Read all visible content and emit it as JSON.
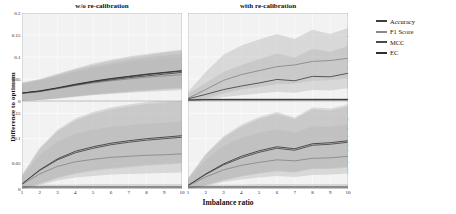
{
  "chart_data": {
    "type": "line",
    "title": "",
    "xlabel": "Imbalance ratio",
    "ylabel": "Difference to optimum",
    "grid": true,
    "legend_position": "right",
    "legend": [
      "Accuracy",
      "F1 Score",
      "MCC",
      "EC"
    ],
    "colors": {
      "accuracy": "#3f3f3f",
      "f1": "#8a8a8a",
      "mcc": "#4a4a4a",
      "ec": "#2e2e2e",
      "band": "#b8b8b8",
      "panel_bg": "#f2f2f2",
      "gridline": "#ffffff"
    },
    "facet_cols": [
      "w/o re-calibration",
      "with re-calibration"
    ],
    "facet_rows": [
      "Argmax decision",
      "Optimised threshold"
    ],
    "x": [
      1,
      2,
      3,
      4,
      5,
      6,
      7,
      8,
      9,
      10
    ],
    "xlim": [
      1,
      10
    ],
    "xticks": [
      "1",
      "2",
      "3",
      "4",
      "5",
      "6",
      "7",
      "8",
      "9",
      "10"
    ],
    "row_yticks": [
      [
        "0.2",
        "0.15",
        "0.1",
        "0.05",
        "0"
      ],
      [
        "0.15",
        "0.1",
        "0.05",
        "0"
      ]
    ],
    "row_ylim": [
      [
        0,
        0.2
      ],
      [
        0,
        0.175
      ]
    ],
    "panels": [
      {
        "row": "Argmax decision",
        "col": "w/o re-calibration",
        "series": [
          {
            "name": "Accuracy",
            "values": [
              0.018,
              0.022,
              0.029,
              0.037,
              0.044,
              0.05,
              0.055,
              0.06,
              0.064,
              0.068
            ],
            "band_lo": [
              0.0,
              0.002,
              0.006,
              0.011,
              0.015,
              0.019,
              0.022,
              0.025,
              0.028,
              0.03
            ],
            "band_hi": [
              0.041,
              0.049,
              0.06,
              0.072,
              0.082,
              0.091,
              0.098,
              0.104,
              0.11,
              0.114
            ]
          },
          {
            "name": "F1 Score",
            "values": [
              0.017,
              0.021,
              0.028,
              0.035,
              0.041,
              0.046,
              0.05,
              0.054,
              0.057,
              0.06
            ],
            "band_lo": [
              0.0,
              0.002,
              0.005,
              0.009,
              0.013,
              0.016,
              0.019,
              0.021,
              0.023,
              0.025
            ],
            "band_hi": [
              0.038,
              0.046,
              0.056,
              0.066,
              0.075,
              0.082,
              0.088,
              0.093,
              0.097,
              0.1
            ]
          },
          {
            "name": "MCC",
            "values": [
              0.018,
              0.022,
              0.029,
              0.036,
              0.043,
              0.048,
              0.053,
              0.057,
              0.061,
              0.065
            ],
            "band_lo": [
              0.0,
              0.002,
              0.006,
              0.01,
              0.014,
              0.017,
              0.02,
              0.023,
              0.026,
              0.028
            ],
            "band_hi": [
              0.04,
              0.048,
              0.058,
              0.069,
              0.078,
              0.086,
              0.093,
              0.099,
              0.104,
              0.108
            ]
          },
          {
            "name": "EC",
            "values": [
              0.018,
              0.023,
              0.03,
              0.038,
              0.045,
              0.051,
              0.056,
              0.061,
              0.065,
              0.069
            ],
            "band_lo": [
              0.0,
              0.003,
              0.007,
              0.012,
              0.016,
              0.02,
              0.023,
              0.026,
              0.029,
              0.032
            ],
            "band_hi": [
              0.042,
              0.05,
              0.062,
              0.074,
              0.085,
              0.094,
              0.101,
              0.107,
              0.112,
              0.117
            ]
          }
        ]
      },
      {
        "row": "Argmax decision",
        "col": "with re-calibration",
        "series": [
          {
            "name": "Accuracy",
            "values": [
              0.002,
              0.003,
              0.003,
              0.003,
              0.003,
              0.003,
              0.003,
              0.003,
              0.003,
              0.003
            ],
            "band_lo": [
              0.0,
              0.0,
              0.0,
              0.0,
              0.0,
              0.0,
              0.0,
              0.0,
              0.0,
              0.0
            ],
            "band_hi": [
              0.005,
              0.006,
              0.006,
              0.007,
              0.007,
              0.007,
              0.007,
              0.007,
              0.007,
              0.007
            ]
          },
          {
            "name": "F1 Score",
            "values": [
              0.006,
              0.026,
              0.047,
              0.06,
              0.069,
              0.078,
              0.082,
              0.09,
              0.092,
              0.097
            ],
            "band_lo": [
              0.0,
              0.006,
              0.017,
              0.026,
              0.032,
              0.038,
              0.04,
              0.046,
              0.047,
              0.051
            ],
            "band_hi": [
              0.021,
              0.066,
              0.105,
              0.126,
              0.14,
              0.152,
              0.141,
              0.162,
              0.152,
              0.166
            ]
          },
          {
            "name": "MCC",
            "values": [
              0.005,
              0.015,
              0.026,
              0.034,
              0.041,
              0.049,
              0.046,
              0.056,
              0.055,
              0.063
            ],
            "band_lo": [
              0.0,
              0.003,
              0.009,
              0.013,
              0.017,
              0.021,
              0.019,
              0.025,
              0.024,
              0.029
            ],
            "band_hi": [
              0.016,
              0.041,
              0.066,
              0.082,
              0.095,
              0.108,
              0.099,
              0.118,
              0.112,
              0.125
            ]
          },
          {
            "name": "EC",
            "values": [
              0.002,
              0.003,
              0.003,
              0.003,
              0.003,
              0.003,
              0.003,
              0.003,
              0.003,
              0.003
            ],
            "band_lo": [
              0.0,
              0.0,
              0.0,
              0.0,
              0.0,
              0.0,
              0.0,
              0.0,
              0.0,
              0.0
            ],
            "band_hi": [
              0.005,
              0.006,
              0.006,
              0.006,
              0.006,
              0.006,
              0.006,
              0.006,
              0.006,
              0.006
            ]
          }
        ]
      },
      {
        "row": "Optimised threshold",
        "col": "w/o re-calibration",
        "series": [
          {
            "name": "Accuracy",
            "values": [
              0.01,
              0.038,
              0.06,
              0.075,
              0.084,
              0.091,
              0.096,
              0.1,
              0.103,
              0.106
            ],
            "band_lo": [
              0.0,
              0.011,
              0.023,
              0.032,
              0.038,
              0.042,
              0.045,
              0.048,
              0.05,
              0.052
            ],
            "band_hi": [
              0.028,
              0.082,
              0.118,
              0.14,
              0.153,
              0.162,
              0.168,
              0.173,
              0.176,
              0.179
            ]
          },
          {
            "name": "F1 Score",
            "values": [
              0.009,
              0.03,
              0.045,
              0.054,
              0.059,
              0.063,
              0.065,
              0.067,
              0.068,
              0.07
            ],
            "band_lo": [
              0.0,
              0.008,
              0.017,
              0.023,
              0.026,
              0.029,
              0.03,
              0.031,
              0.032,
              0.033
            ],
            "band_hi": [
              0.025,
              0.068,
              0.095,
              0.11,
              0.118,
              0.124,
              0.127,
              0.13,
              0.132,
              0.134
            ]
          },
          {
            "name": "MCC",
            "values": [
              0.01,
              0.037,
              0.058,
              0.072,
              0.081,
              0.088,
              0.093,
              0.097,
              0.1,
              0.103
            ],
            "band_lo": [
              0.0,
              0.01,
              0.022,
              0.03,
              0.036,
              0.04,
              0.043,
              0.046,
              0.048,
              0.05
            ],
            "band_hi": [
              0.027,
              0.08,
              0.115,
              0.136,
              0.149,
              0.158,
              0.164,
              0.169,
              0.172,
              0.175
            ]
          },
          {
            "name": "EC",
            "values": [
              0.004,
              0.004,
              0.004,
              0.004,
              0.004,
              0.004,
              0.004,
              0.004,
              0.004,
              0.004
            ],
            "band_lo": [
              0.0,
              0.0,
              0.0,
              0.0,
              0.0,
              0.0,
              0.0,
              0.0,
              0.0,
              0.0
            ],
            "band_hi": [
              0.009,
              0.009,
              0.009,
              0.009,
              0.01,
              0.01,
              0.01,
              0.01,
              0.01,
              0.01
            ]
          }
        ]
      },
      {
        "row": "Optimised threshold",
        "col": "with re-calibration",
        "series": [
          {
            "name": "Accuracy",
            "values": [
              0.007,
              0.03,
              0.05,
              0.065,
              0.076,
              0.084,
              0.08,
              0.09,
              0.092,
              0.096
            ],
            "band_lo": [
              0.0,
              0.008,
              0.018,
              0.026,
              0.032,
              0.037,
              0.034,
              0.041,
              0.042,
              0.045
            ],
            "band_hi": [
              0.022,
              0.07,
              0.105,
              0.128,
              0.143,
              0.153,
              0.142,
              0.162,
              0.16,
              0.168
            ]
          },
          {
            "name": "F1 Score",
            "values": [
              0.006,
              0.024,
              0.038,
              0.047,
              0.053,
              0.058,
              0.056,
              0.061,
              0.062,
              0.065
            ],
            "band_lo": [
              0.0,
              0.006,
              0.014,
              0.019,
              0.023,
              0.026,
              0.024,
              0.028,
              0.029,
              0.031
            ],
            "band_hi": [
              0.019,
              0.058,
              0.086,
              0.102,
              0.112,
              0.119,
              0.112,
              0.125,
              0.124,
              0.129
            ]
          },
          {
            "name": "MCC",
            "values": [
              0.007,
              0.029,
              0.048,
              0.062,
              0.073,
              0.081,
              0.077,
              0.087,
              0.089,
              0.093
            ],
            "band_lo": [
              0.0,
              0.008,
              0.017,
              0.025,
              0.031,
              0.035,
              0.033,
              0.04,
              0.04,
              0.043
            ],
            "band_hi": [
              0.021,
              0.068,
              0.102,
              0.124,
              0.139,
              0.149,
              0.139,
              0.158,
              0.156,
              0.164
            ]
          },
          {
            "name": "EC",
            "values": [
              0.004,
              0.004,
              0.004,
              0.004,
              0.004,
              0.004,
              0.004,
              0.004,
              0.004,
              0.004
            ],
            "band_lo": [
              0.0,
              0.0,
              0.0,
              0.0,
              0.0,
              0.0,
              0.0,
              0.0,
              0.0,
              0.0
            ],
            "band_hi": [
              0.009,
              0.009,
              0.009,
              0.009,
              0.01,
              0.01,
              0.01,
              0.01,
              0.01,
              0.01
            ]
          }
        ]
      }
    ]
  }
}
